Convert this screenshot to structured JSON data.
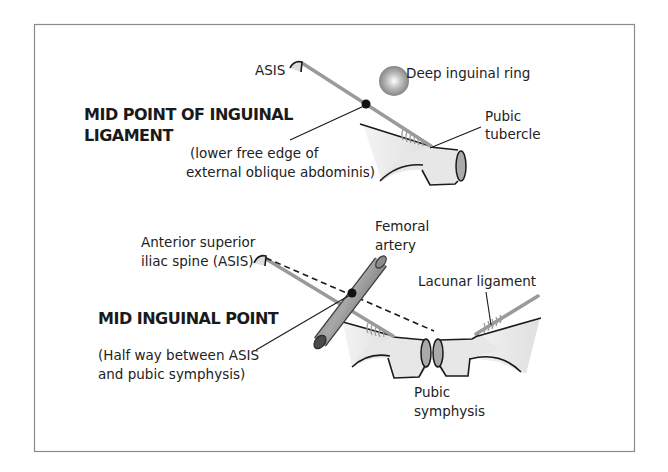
{
  "top_panel": {
    "title_line1": "MID POINT OF INGUINAL",
    "title_line2": "LIGAMENT",
    "note_line1": "(lower free edge of",
    "note_line2": "external oblique abdominis)",
    "labels": {
      "asis": "ASIS",
      "deep_ring": "Deep inguinal ring",
      "pubic_tubercle_line1": "Pubic",
      "pubic_tubercle_line2": "tubercle"
    }
  },
  "bottom_panel": {
    "title": "MID INGUINAL POINT",
    "note_line1": "(Half way between ASIS",
    "note_line2": "and pubic symphysis)",
    "labels": {
      "asis_line1": "Anterior superior",
      "asis_line2": "iliac spine (ASIS)",
      "femoral_line1": "Femoral",
      "femoral_line2": "artery",
      "lacunar": "Lacunar ligament",
      "symphysis_line1": "Pubic",
      "symphysis_line2": "symphysis"
    }
  },
  "colors": {
    "border": "#8a8a8a",
    "ligament": "#9a9a9a",
    "bone_fill": "#e6e6e6",
    "artery": "#7d7d7d",
    "outline": "#1a1a1a"
  }
}
